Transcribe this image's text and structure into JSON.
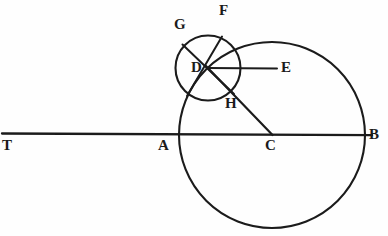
{
  "figure": {
    "labels": {
      "T": "T",
      "A": "A",
      "C": "C",
      "B": "B",
      "D": "D",
      "E": "E",
      "F": "F",
      "G": "G",
      "H": "H"
    },
    "colors": {
      "ink": "#1b1b1b",
      "background": "#fefefe"
    },
    "geometry": {
      "large_circle": {
        "center": [
          272,
          135
        ],
        "radius": 93
      },
      "small_circle": {
        "center": [
          208,
          68
        ],
        "radius": 32.5
      },
      "baseline": {
        "from": [
          2,
          134
        ],
        "to": [
          372,
          135
        ]
      },
      "segment_DE": {
        "from": [
          208,
          68
        ],
        "to": [
          277,
          68
        ]
      },
      "segment_GD_extended": {
        "from": [
          183,
          45
        ],
        "to": [
          233,
          93
        ]
      },
      "segment_FD_extended": {
        "from": [
          222,
          37
        ],
        "to": [
          188,
          96
        ]
      },
      "segment_DC": {
        "from": [
          208,
          68
        ],
        "to": [
          272,
          135
        ]
      }
    }
  }
}
